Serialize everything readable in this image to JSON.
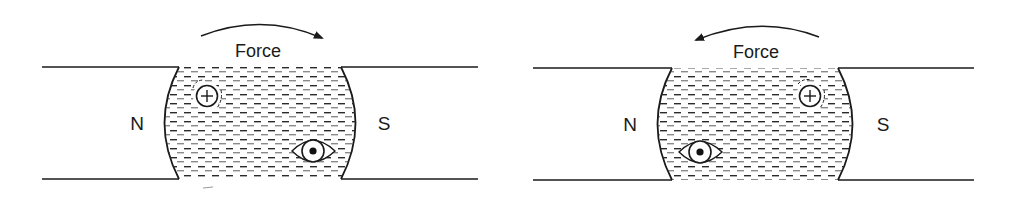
{
  "diagram": {
    "panels": [
      {
        "id": "left",
        "force_label": "Force",
        "force_direction": "clockwise",
        "north_label": "N",
        "south_label": "S",
        "plus_conductor_symbol": "+",
        "dot_conductor_symbol": "dot"
      },
      {
        "id": "right",
        "force_label": "Force",
        "force_direction": "counterclockwise",
        "north_label": "N",
        "south_label": "S",
        "plus_conductor_symbol": "+",
        "dot_conductor_symbol": "dot"
      }
    ],
    "colors": {
      "line": "#1a1a1a",
      "background": "#ffffff"
    }
  }
}
